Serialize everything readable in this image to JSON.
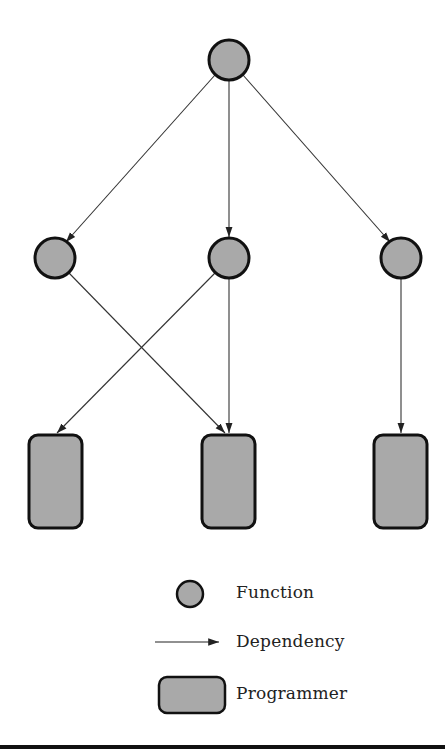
{
  "diagram": {
    "type": "dependency-graph",
    "colors": {
      "node_fill": "#a9a9a9",
      "node_stroke": "#111111",
      "edge": "#333333"
    },
    "nodes": [
      {
        "id": "f0",
        "kind": "function",
        "cx": 229,
        "cy": 60
      },
      {
        "id": "f1",
        "kind": "function",
        "cx": 55,
        "cy": 258
      },
      {
        "id": "f2",
        "kind": "function",
        "cx": 229,
        "cy": 258
      },
      {
        "id": "f3",
        "kind": "function",
        "cx": 401,
        "cy": 258
      },
      {
        "id": "p1",
        "kind": "programmer",
        "x": 28,
        "y": 434,
        "w": 54,
        "h": 94
      },
      {
        "id": "p2",
        "kind": "programmer",
        "x": 201,
        "y": 434,
        "w": 54,
        "h": 94
      },
      {
        "id": "p3",
        "kind": "programmer",
        "x": 373,
        "y": 434,
        "w": 54,
        "h": 94
      }
    ],
    "edges": [
      {
        "from": "f0",
        "to": "f1"
      },
      {
        "from": "f0",
        "to": "f2"
      },
      {
        "from": "f0",
        "to": "f3"
      },
      {
        "from": "f1",
        "to": "p2"
      },
      {
        "from": "f2",
        "to": "p1"
      },
      {
        "from": "f2",
        "to": "p2"
      },
      {
        "from": "f3",
        "to": "p3"
      }
    ]
  },
  "legend": {
    "items": [
      {
        "symbol": "circle",
        "label": "Function"
      },
      {
        "symbol": "arrow",
        "label": "Dependency"
      },
      {
        "symbol": "rounded-rect",
        "label": "Programmer"
      }
    ]
  }
}
